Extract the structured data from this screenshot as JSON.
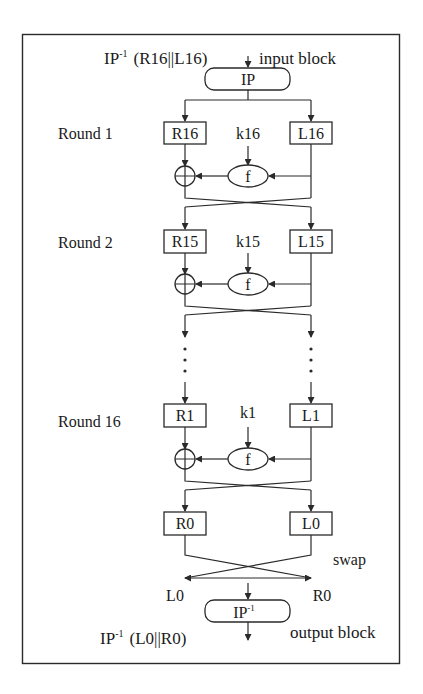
{
  "diagram": {
    "top_left_label": "IP",
    "top_left_sup": "-1",
    "top_left_expr": "(R16||L16)",
    "input_label": "input block",
    "ip_box": "IP",
    "rounds": [
      {
        "label": "Round 1",
        "left": "R16",
        "key": "k16",
        "right": "L16",
        "func": "f"
      },
      {
        "label": "Round 2",
        "left": "R15",
        "key": "k15",
        "right": "L15",
        "func": "f"
      },
      {
        "label": "Round 16",
        "left": "R1",
        "key": "k1",
        "right": "L1",
        "func": "f"
      }
    ],
    "final_left": "R0",
    "final_right": "L0",
    "swap_label": "swap",
    "after_swap_left": "L0",
    "after_swap_right": "R0",
    "ipinv_box": "IP",
    "ipinv_sup": "-1",
    "bottom_left_label": "IP",
    "bottom_left_sup": "-1",
    "bottom_left_expr": "(L0||R0)",
    "output_label": "output block",
    "ellipsis": "⋮"
  }
}
